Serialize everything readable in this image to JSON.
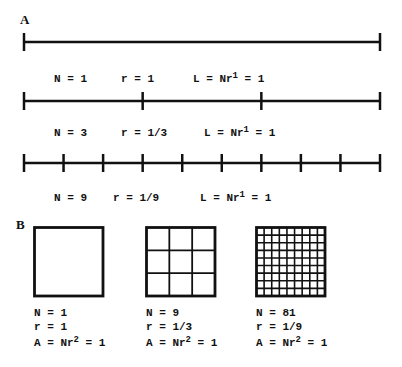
{
  "panels": {
    "A": {
      "label": "A",
      "rows": [
        {
          "segments": 1,
          "N": "N = 1",
          "r": "r = 1",
          "L_prefix": "L = Nr",
          "L_exp": "1",
          "L_suffix": " = 1"
        },
        {
          "segments": 3,
          "N": "N = 3",
          "r": "r = 1/3",
          "L_prefix": "L = Nr",
          "L_exp": "1",
          "L_suffix": " = 1"
        },
        {
          "segments": 9,
          "N": "N = 9",
          "r": "r = 1/9",
          "L_prefix": "L = Nr",
          "L_exp": "1",
          "L_suffix": " = 1"
        }
      ]
    },
    "B": {
      "label": "B",
      "squares": [
        {
          "divisions": 1,
          "N": "N = 1",
          "r": "r = 1",
          "A_prefix": "A = Nr",
          "A_exp": "2",
          "A_suffix": " = 1"
        },
        {
          "divisions": 3,
          "N": "N = 9",
          "r": "r = 1/3",
          "A_prefix": "A = Nr",
          "A_exp": "2",
          "A_suffix": " = 1"
        },
        {
          "divisions": 9,
          "N": "N = 81",
          "r": "r = 1/9",
          "A_prefix": "A = Nr",
          "A_exp": "2",
          "A_suffix": " = 1"
        }
      ]
    }
  },
  "colors": {
    "stroke": "#111111",
    "background": "#ffffff"
  }
}
